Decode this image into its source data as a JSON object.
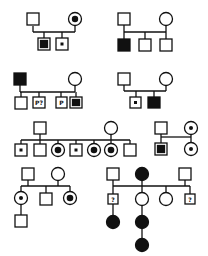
{
  "legend_semantics": {
    "square": "male",
    "circle": "female",
    "filled": "affected",
    "center-dot": "carrier",
    "inner-square": "affected (boxed)",
    "question": "unknown status"
  },
  "colors": {
    "stroke": "#111111",
    "fill": "#ffffff"
  },
  "pedigrees": [
    {
      "id": 1,
      "parents": [
        {
          "sex": "male",
          "status": "unaffected"
        },
        {
          "sex": "female",
          "status": "carrier-large-dot"
        }
      ],
      "children": [
        {
          "sex": "male",
          "status": "inner-filled"
        },
        {
          "sex": "male",
          "status": "carrier-dot"
        }
      ]
    },
    {
      "id": 2,
      "parents": [
        {
          "sex": "male",
          "status": "unaffected"
        },
        {
          "sex": "female",
          "status": "unaffected"
        }
      ],
      "children": [
        {
          "sex": "male",
          "status": "affected"
        },
        {
          "sex": "male",
          "status": "unaffected"
        },
        {
          "sex": "male",
          "status": "unaffected"
        }
      ]
    },
    {
      "id": 3,
      "parents": [
        {
          "sex": "male",
          "status": "affected"
        },
        {
          "sex": "female",
          "status": "unaffected"
        }
      ],
      "children": [
        {
          "sex": "male",
          "status": "unaffected"
        },
        {
          "sex": "male",
          "status": "label",
          "label": "P?"
        },
        {
          "sex": "male",
          "status": "label",
          "label": "P"
        },
        {
          "sex": "male",
          "status": "inner-filled"
        }
      ]
    },
    {
      "id": 4,
      "parents": [
        {
          "sex": "male",
          "status": "unaffected"
        },
        {
          "sex": "female",
          "status": "unaffected"
        }
      ],
      "children": [
        {
          "sex": "male",
          "status": "carrier-dot"
        },
        {
          "sex": "male",
          "status": "affected"
        }
      ]
    },
    {
      "id": 5,
      "parents": [
        {
          "sex": "male",
          "status": "unaffected"
        },
        {
          "sex": "female",
          "status": "unaffected"
        }
      ],
      "children": [
        {
          "sex": "male",
          "status": "carrier-dot"
        },
        {
          "sex": "male",
          "status": "unaffected"
        },
        {
          "sex": "female",
          "status": "carrier-large-dot"
        },
        {
          "sex": "male",
          "status": "carrier-dot"
        },
        {
          "sex": "female",
          "status": "carrier-large-dot"
        },
        {
          "sex": "female",
          "status": "carrier-large-dot"
        },
        {
          "sex": "male",
          "status": "unaffected"
        }
      ]
    },
    {
      "id": 6,
      "members": [
        {
          "sex": "male",
          "status": "unaffected",
          "gen": 1
        },
        {
          "sex": "female",
          "status": "carrier-dot",
          "gen": 1
        },
        {
          "sex": "male",
          "status": "inner-filled",
          "gen": 2
        },
        {
          "sex": "female",
          "status": "carrier-dot",
          "gen": 2
        }
      ]
    },
    {
      "id": 7,
      "parents": [
        {
          "sex": "male",
          "status": "unaffected"
        },
        {
          "sex": "female",
          "status": "unaffected"
        }
      ],
      "children": [
        {
          "sex": "female",
          "status": "carrier-dot"
        },
        {
          "sex": "male",
          "status": "unaffected"
        },
        {
          "sex": "female",
          "status": "carrier-large-dot"
        }
      ],
      "grandchildren": [
        {
          "sex": "male",
          "status": "unaffected"
        }
      ]
    },
    {
      "id": 8,
      "founders": [
        {
          "sex": "male",
          "status": "unaffected"
        },
        {
          "sex": "female",
          "status": "affected"
        },
        {
          "sex": "male",
          "status": "unaffected"
        }
      ],
      "children": [
        {
          "sex": "male",
          "status": "label",
          "label": "?"
        },
        {
          "sex": "female",
          "status": "unaffected"
        },
        {
          "sex": "female",
          "status": "unaffected"
        },
        {
          "sex": "male",
          "status": "label",
          "label": "?"
        }
      ],
      "descendants": [
        {
          "sex": "female",
          "status": "affected",
          "under": "child-1"
        },
        {
          "sex": "female",
          "status": "affected",
          "under": "child-2"
        },
        {
          "sex": "female",
          "status": "affected",
          "under": "grandchild-2"
        }
      ]
    }
  ],
  "labels": {
    "p3_child2": "P?",
    "p3_child3": "P",
    "p8_child1": "?",
    "p8_child4": "?"
  }
}
